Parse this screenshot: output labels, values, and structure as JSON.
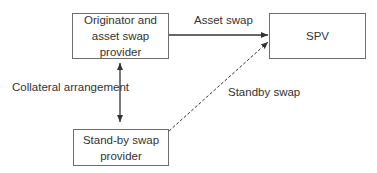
{
  "diagram": {
    "nodes": [
      {
        "id": "originator",
        "label": "Originator and\nasset swap provider"
      },
      {
        "id": "spv",
        "label": "SPV"
      },
      {
        "id": "standby",
        "label": "Stand-by swap\nprovider"
      }
    ],
    "edges": [
      {
        "from": "originator",
        "to": "spv",
        "label": "Asset swap",
        "style": "solid",
        "arrow": "end"
      },
      {
        "from": "standby",
        "to": "spv",
        "label": "Standby swap",
        "style": "dashed",
        "arrow": "end"
      },
      {
        "from": "originator",
        "to": "standby",
        "label": "Collateral arrangement",
        "style": "solid",
        "arrow": "both"
      }
    ],
    "colors": {
      "line": "#333333",
      "box_border": "#6e6e6e",
      "text": "#333333",
      "background": "#ffffff"
    }
  }
}
